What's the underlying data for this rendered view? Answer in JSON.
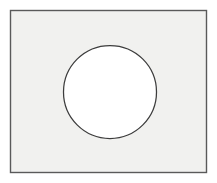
{
  "figure": {
    "canvas": {
      "width": 217,
      "height": 183,
      "background_color": "#ffffff"
    },
    "shapes": [
      {
        "name": "rectangle",
        "label": "Outer rectangle plate",
        "x": 10.5,
        "y": 10.5,
        "width": 196,
        "height": 162,
        "fill_color": "#f1f1ef",
        "stroke_color": "#5a5a5a",
        "stroke_width": 1.4
      },
      {
        "name": "circle",
        "label": "Inscribed circle",
        "center_x": 110,
        "center_y": 92,
        "radius": 46.5,
        "diameter": 93,
        "fill_color": "#ffffff",
        "stroke_color": "#3c3c3c",
        "stroke_width": 1.25
      }
    ],
    "caption": ""
  }
}
